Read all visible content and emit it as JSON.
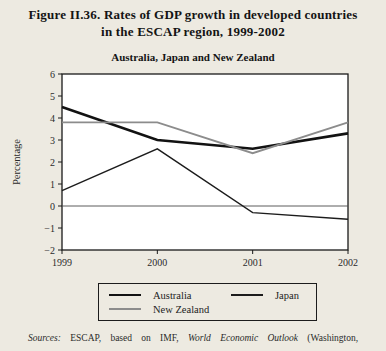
{
  "figure": {
    "title_line1": "Figure II.36.  Rates of GDP growth in developed countries",
    "title_line2": "in the ESCAP region, 1999-2002",
    "subtitle": "Australia, Japan and New Zealand"
  },
  "chart_data": {
    "type": "line",
    "title": "Australia, Japan and New Zealand",
    "xlabel": "",
    "ylabel": "Percentage",
    "x": [
      1999,
      2000,
      2001,
      2002
    ],
    "x_tick_labels": [
      "1999",
      "2000",
      "2001",
      "2002"
    ],
    "ylim": [
      -2,
      6
    ],
    "y_ticks": [
      6,
      5,
      4,
      3,
      2,
      1,
      0,
      -1,
      -2
    ],
    "grid": false,
    "zero_line_y": 0,
    "legend_position": "bottom-box",
    "series": [
      {
        "name": "Australia",
        "color": "#121212",
        "width": 2.6,
        "values": [
          4.5,
          3.0,
          2.6,
          3.3
        ]
      },
      {
        "name": "Japan",
        "color": "#1c1c1c",
        "width": 1.4,
        "values": [
          0.7,
          2.6,
          -0.3,
          -0.6
        ]
      },
      {
        "name": "New Zealand",
        "color": "#8c8c8c",
        "width": 1.8,
        "values": [
          3.8,
          3.8,
          2.4,
          3.8
        ]
      }
    ]
  },
  "sources": {
    "prefix": "Sources:",
    "part1": "ESCAP, based on IMF,",
    "italic_title": "World Economic Outlook",
    "part2": "(Washington,"
  },
  "colors": {
    "background": "#edeae1",
    "plot_background": "#ffffff",
    "axis": "#1a1a1a",
    "zero_line": "#4a4a4a",
    "text": "#141414"
  }
}
